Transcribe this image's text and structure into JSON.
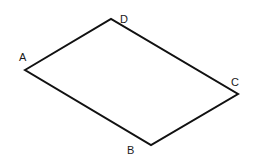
{
  "diagram": {
    "type": "parallelogram",
    "stroke_color": "#111111",
    "background": "#ffffff",
    "vertices": [
      {
        "name": "A",
        "x": 25,
        "y": 70,
        "label_x": 19,
        "label_y": 61
      },
      {
        "name": "D",
        "x": 111,
        "y": 19,
        "label_x": 120,
        "label_y": 23
      },
      {
        "name": "C",
        "x": 238,
        "y": 94,
        "label_x": 231,
        "label_y": 86
      },
      {
        "name": "B",
        "x": 151,
        "y": 145,
        "label_x": 127,
        "label_y": 154
      }
    ],
    "edges": [
      [
        "A",
        "D"
      ],
      [
        "D",
        "C"
      ],
      [
        "C",
        "B"
      ],
      [
        "B",
        "A"
      ]
    ]
  }
}
